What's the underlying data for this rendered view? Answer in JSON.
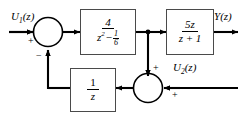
{
  "diagram": {
    "type": "control-block-diagram",
    "background_color": "#ffffff",
    "line_color": "#000000",
    "block_border_color": "#4a4a4a",
    "inputs": [
      {
        "name": "u1",
        "label": "U",
        "subscript": "1",
        "arg": "(z)",
        "sign": "+"
      },
      {
        "name": "u2",
        "label": "U",
        "subscript": "2",
        "arg": "(z)",
        "sign": "+"
      }
    ],
    "outputs": [
      {
        "name": "y",
        "label": "Y",
        "subscript": "",
        "arg": "(z)"
      }
    ],
    "blocks": [
      {
        "name": "forward-block-1",
        "numerator": "4",
        "denominator_base": "z",
        "denominator_exp": "2",
        "denominator_op": "−",
        "denominator_frac_num": "1",
        "denominator_frac_den": "6",
        "transfer_function": "4 / (z^2 - 1/6)"
      },
      {
        "name": "forward-block-2",
        "numerator": "5z",
        "denominator": "z + 1",
        "transfer_function": "5z / (z + 1)"
      },
      {
        "name": "feedback-block-delay",
        "numerator": "1",
        "denominator": "z",
        "transfer_function": "1 / z"
      }
    ],
    "summing_junctions": [
      {
        "name": "summer-input",
        "left_input_sign": "+",
        "bottom_input_sign": "−"
      },
      {
        "name": "summer-feedback",
        "top_input_sign": "+",
        "right_input_sign": "+"
      }
    ],
    "nodes": [
      {
        "name": "takeoff-node",
        "label": ""
      }
    ]
  }
}
